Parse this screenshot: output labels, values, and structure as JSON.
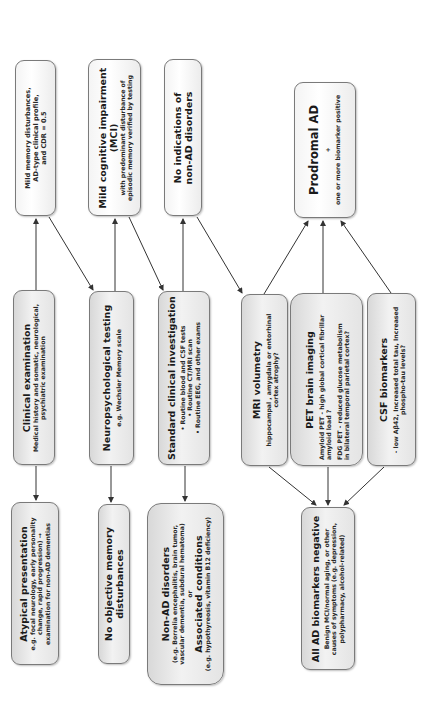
{
  "diagram": {
    "orientation": "rotated 90° counter-clockwise",
    "columns": {
      "outcomes": [
        {
          "id": "mild-memory",
          "lines": [
            "Mild memory disturbances,",
            "AD-type clinical profile,",
            "and CDR = 0.5"
          ]
        },
        {
          "id": "mci",
          "title": [
            "Mild cognitive impairment",
            "(MCI)"
          ],
          "lines": [
            "with predominant disturbance of",
            "episodic memory verified by testing"
          ]
        },
        {
          "id": "no-indications",
          "title": [
            "No indications of",
            "non-AD disorders"
          ]
        },
        {
          "id": "prodromal-ad",
          "title": [
            "Prodromal AD"
          ],
          "plus": "+",
          "lines": [
            "one or more biomarker positive"
          ]
        }
      ],
      "steps": [
        {
          "id": "clinical-exam",
          "title": "Clinical examination",
          "lines": [
            "Medical history and somatic, neurological,",
            "psychiatric examination"
          ]
        },
        {
          "id": "neuropsych",
          "title": "Neuropsychological testing",
          "lines": [
            "e.g. Wechsler Memory scale"
          ]
        },
        {
          "id": "standard-clinical",
          "title": "Standard clinical investigation",
          "lines": [
            "• Routine blood and CSF tests",
            "• Routine CT/MRI scan",
            "• Routine EEG, and other exams"
          ]
        },
        {
          "id": "mri",
          "title": "MRI volumetry",
          "lines": [
            "hippocampal , amygdala or entorhinal",
            "cortex atrophy?"
          ]
        },
        {
          "id": "pet",
          "title": "PET brain imaging",
          "groups": [
            [
              "Amyloid PET  -  high global cortical fibrillar",
              "amyloid load ?"
            ],
            [
              "FDG PET  -  reduced glucose metabolism",
              "in bilateral temporal parietal cortex?"
            ]
          ]
        },
        {
          "id": "csf",
          "title": "CSF biomarkers",
          "lines": [
            "- low Aβ42, Increased total tau, Increased",
            "phospho-tau levels?"
          ]
        }
      ],
      "exclusions": [
        {
          "id": "atypical",
          "title": "Atypical presentation",
          "lines": [
            "e.g. focal neurology, early personality",
            "change, rapid progression)  →",
            "examination for non-AD dementias"
          ]
        },
        {
          "id": "no-objective",
          "title": [
            "No objective memory",
            "disturbances"
          ]
        },
        {
          "id": "non-ad",
          "title": "Non-AD disorders",
          "lines": [
            "(e.g. Borrelia encephalitis, brain tumor,",
            "vascular dementia, subdural hematoma)"
          ],
          "or": "or",
          "title2": "Associated conditions",
          "lines2": [
            "(e.g. hypothyreosis, vitamin B12 deficiency)"
          ]
        },
        {
          "id": "all-negative",
          "title": "All AD biomarkers negative",
          "lines": [
            "Benign MCI/normal aging, or other",
            "causes of symptoms (e.g. depression,",
            "polypharmacy, alcohol-related)"
          ]
        }
      ]
    },
    "colors": {
      "border": "#7a7a7a",
      "arrow": "#333333",
      "box_light": "#f6f6f6",
      "box_shaded": "#e0e0e0",
      "text": "#1a1a1a"
    }
  }
}
